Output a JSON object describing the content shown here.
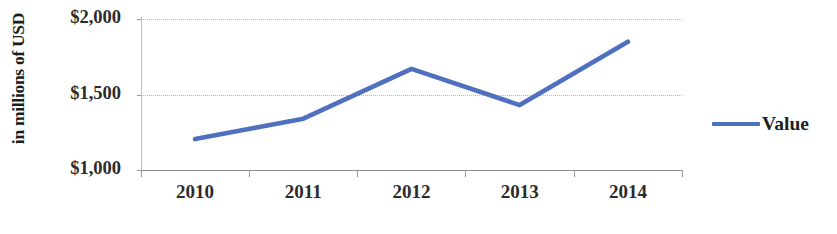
{
  "chart_data": {
    "type": "line",
    "title": "",
    "subtitle": "",
    "xlabel": "",
    "ylabel": "in millions of USD",
    "categories": [
      "2010",
      "2011",
      "2012",
      "2013",
      "2014"
    ],
    "series": [
      {
        "name": "Value",
        "color": "#4f6fbf",
        "values": [
          1205,
          1340,
          1670,
          1430,
          1850
        ]
      }
    ],
    "ylim": [
      1000,
      2000
    ],
    "y_ticks": [
      1000,
      1500,
      2000
    ],
    "y_tick_labels": [
      "$1,000",
      "$1,500",
      "$2,000"
    ],
    "grid": true,
    "grid_axis": "y",
    "legend_position": "right",
    "legend_entries": [
      "Value"
    ],
    "annotations": []
  },
  "axes": {
    "y_title": "in millions of USD",
    "y_labels": {
      "top": "$2,000",
      "middle": "$1,500",
      "bottom": "$1,000"
    },
    "x_labels": [
      "2010",
      "2011",
      "2012",
      "2013",
      "2014"
    ]
  },
  "legend": {
    "items": [
      {
        "label": "Value",
        "color": "#4f6fbf",
        "marker": "line-swatch"
      }
    ]
  },
  "colors": {
    "series_blue": "#4f6fbf",
    "gridline": "#b9b9b9",
    "axis": "#8f8f8f",
    "text": "#2b2b2b",
    "background": "#ffffff"
  }
}
